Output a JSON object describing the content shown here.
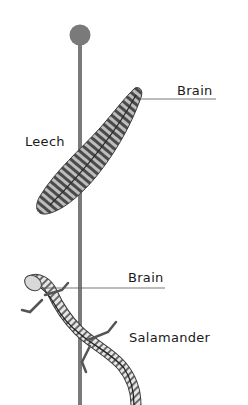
{
  "diagram": {
    "labels": {
      "leech": "Leech",
      "leech_brain": "Brain",
      "salamander_brain": "Brain",
      "salamander": "Salamander"
    },
    "colors": {
      "pole": "#7a7a7a",
      "line": "#555555",
      "text": "#1a1a1a"
    }
  }
}
